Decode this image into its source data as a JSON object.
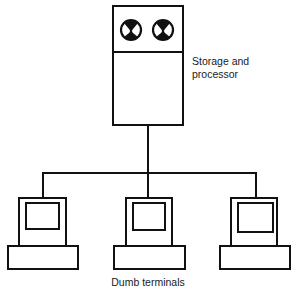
{
  "diagram": {
    "type": "centralized-computing-topology",
    "host": {
      "label_line1": "Storage and",
      "label_line2": "processor",
      "icons": [
        "tape-reel-icon",
        "tape-reel-icon"
      ]
    },
    "terminals": {
      "label": "Dumb terminals",
      "count": 3,
      "items": [
        {
          "name": "terminal-left"
        },
        {
          "name": "terminal-middle"
        },
        {
          "name": "terminal-right"
        }
      ]
    },
    "colors": {
      "line": "#111111",
      "background": "#ffffff"
    }
  }
}
